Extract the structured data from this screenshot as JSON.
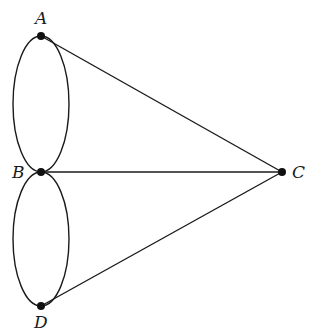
{
  "diagram": {
    "type": "graph",
    "nodes": [
      {
        "id": "A",
        "label": "A",
        "x": 41,
        "y": 36
      },
      {
        "id": "B",
        "label": "B",
        "x": 41,
        "y": 172
      },
      {
        "id": "C",
        "label": "C",
        "x": 282,
        "y": 172
      },
      {
        "id": "D",
        "label": "D",
        "x": 41,
        "y": 306
      }
    ],
    "edges": [
      {
        "from": "A",
        "to": "B",
        "style": "curved-left"
      },
      {
        "from": "A",
        "to": "B",
        "style": "curved-right"
      },
      {
        "from": "B",
        "to": "D",
        "style": "curved-left"
      },
      {
        "from": "B",
        "to": "D",
        "style": "curved-right"
      },
      {
        "from": "A",
        "to": "C",
        "style": "straight"
      },
      {
        "from": "B",
        "to": "C",
        "style": "straight"
      },
      {
        "from": "D",
        "to": "C",
        "style": "straight"
      }
    ],
    "colors": {
      "stroke": "#1a1a1a",
      "node": "#111111",
      "background": "#ffffff"
    }
  }
}
